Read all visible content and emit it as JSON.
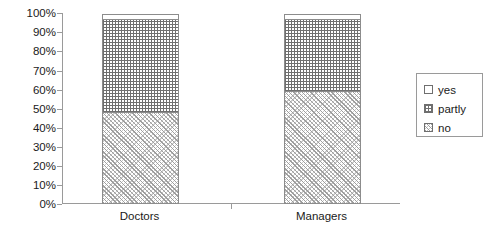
{
  "chart_data": {
    "type": "bar",
    "subtype": "stacked-percentage-column",
    "title": "",
    "subtitle": "",
    "xlabel": "",
    "ylabel": "",
    "categories": [
      "Doctors",
      "Managers"
    ],
    "series": [
      {
        "name": "yes",
        "values": [
          3,
          3
        ],
        "pattern": "empty-white",
        "swatch": "yes-swatch"
      },
      {
        "name": "partly",
        "values": [
          49,
          38
        ],
        "pattern": "fine-grid-hatch",
        "swatch": "partly-swatch"
      },
      {
        "name": "no",
        "values": [
          48,
          59
        ],
        "pattern": "diagonal-hatch",
        "swatch": "no-swatch"
      }
    ],
    "stack_order_bottom_to_top": [
      "no",
      "partly",
      "yes"
    ],
    "ylim": [
      0,
      100
    ],
    "y_tick_labels": [
      "0%",
      "10%",
      "20%",
      "30%",
      "40%",
      "50%",
      "60%",
      "70%",
      "80%",
      "90%",
      "100%"
    ],
    "y_tick_values": [
      0,
      10,
      20,
      30,
      40,
      50,
      60,
      70,
      80,
      90,
      100
    ],
    "grid": false,
    "legend_position": "right",
    "legend_entries": [
      "yes",
      "partly",
      "no"
    ],
    "colors": {
      "axis": "#9a9a9a",
      "bar_outline": "#8c8c8c",
      "text": "#1a1a1a",
      "background": "#ffffff",
      "pattern_dark": "#6f6f6f",
      "pattern_light": "#c9c9c9"
    }
  },
  "axes": {
    "y": {
      "ticks": [
        {
          "label": "100%",
          "value": 100
        },
        {
          "label": "90%",
          "value": 90
        },
        {
          "label": "80%",
          "value": 80
        },
        {
          "label": "70%",
          "value": 70
        },
        {
          "label": "60%",
          "value": 60
        },
        {
          "label": "50%",
          "value": 50
        },
        {
          "label": "40%",
          "value": 40
        },
        {
          "label": "30%",
          "value": 30
        },
        {
          "label": "20%",
          "value": 20
        },
        {
          "label": "10%",
          "value": 10
        },
        {
          "label": "0%",
          "value": 0
        }
      ]
    },
    "x": {
      "ticks": [
        {
          "label": "Doctors"
        },
        {
          "label": "Managers"
        }
      ]
    }
  },
  "legend": {
    "items": [
      {
        "label": "yes"
      },
      {
        "label": "partly"
      },
      {
        "label": "no"
      }
    ]
  }
}
